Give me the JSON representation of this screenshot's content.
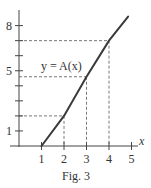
{
  "chart_data": {
    "type": "line",
    "title": "",
    "caption": "Fig. 3",
    "xlabel": "x",
    "ylabel": "",
    "xlim": [
      0,
      5.3
    ],
    "ylim": [
      0,
      8.6
    ],
    "x_ticks": [
      1,
      2,
      3,
      4,
      5
    ],
    "x_tick_labels": [
      "1",
      "2",
      "3",
      "4",
      "5"
    ],
    "y_ticks": [
      1,
      2,
      3,
      4,
      5,
      6,
      7,
      8
    ],
    "y_tick_labels": [
      "1",
      "",
      "",
      "",
      "5",
      "",
      "",
      "8"
    ],
    "grid": false,
    "series": [
      {
        "name": "y = A(x)",
        "x": [
          1,
          2,
          3,
          4,
          4.85
        ],
        "y": [
          0,
          2,
          4.6,
          7,
          8.6
        ]
      }
    ],
    "annotations": [
      {
        "text": "y = A(x)",
        "x": 2.6,
        "y": 5.5
      },
      {
        "type": "dashed-guide",
        "x": 2,
        "y": 2
      },
      {
        "type": "dashed-guide",
        "x": 3,
        "y": 4.6
      },
      {
        "type": "dashed-guide",
        "x": 4,
        "y": 7
      }
    ],
    "colors": {
      "axis": "#444444",
      "curve": "#3a3a3a",
      "guides": "#555555"
    }
  }
}
